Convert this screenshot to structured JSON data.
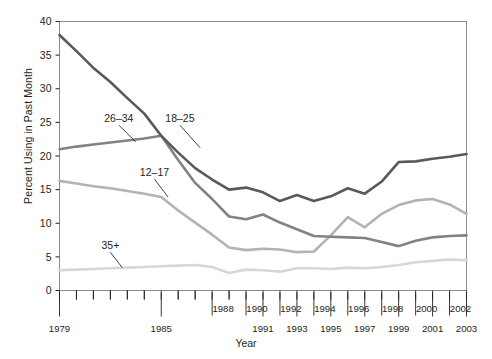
{
  "chart_data": {
    "type": "line",
    "title": "",
    "xlabel": "Year",
    "ylabel": "Percent Using in Past Month",
    "xlim": [
      1979,
      2003
    ],
    "ylim": [
      0,
      40
    ],
    "ytick_values": [
      0,
      5,
      10,
      15,
      20,
      25,
      30,
      35,
      40
    ],
    "ytick_labels": [
      "0",
      "5",
      "10",
      "15",
      "20",
      "25",
      "30",
      "35",
      "40"
    ],
    "grid": false,
    "legend_position": "inline-annotations",
    "x": [
      1979,
      1980,
      1981,
      1982,
      1983,
      1984,
      1985,
      1986,
      1987,
      1988,
      1989,
      1990,
      1991,
      1992,
      1993,
      1994,
      1995,
      1996,
      1997,
      1998,
      1999,
      2000,
      2001,
      2002,
      2003
    ],
    "xtick_upper_row": [
      {
        "year": 1988,
        "label": "1988"
      },
      {
        "year": 1990,
        "label": "1990"
      },
      {
        "year": 1992,
        "label": "1992"
      },
      {
        "year": 1994,
        "label": "1994"
      },
      {
        "year": 1996,
        "label": "1996"
      },
      {
        "year": 1998,
        "label": "1998"
      },
      {
        "year": 2000,
        "label": "2000"
      },
      {
        "year": 2002,
        "label": "2002"
      }
    ],
    "xtick_lower_row": [
      {
        "year": 1979,
        "label": "1979"
      },
      {
        "year": 1985,
        "label": "1985"
      },
      {
        "year": 1991,
        "label": "1991"
      },
      {
        "year": 1993,
        "label": "1993"
      },
      {
        "year": 1995,
        "label": "1995"
      },
      {
        "year": 1997,
        "label": "1997"
      },
      {
        "year": 1999,
        "label": "1999"
      },
      {
        "year": 2001,
        "label": "2001"
      },
      {
        "year": 2003,
        "label": "2003"
      }
    ],
    "series": [
      {
        "name": "18-25",
        "label": "18–25",
        "color": "#58595b",
        "width": 2.6,
        "annotation": {
          "text_x": 1986.1,
          "text_y": 25.1,
          "leader_to_x": 1987.3,
          "leader_to_y": 21.2
        },
        "values": [
          38.0,
          35.6,
          33.1,
          31.0,
          28.6,
          26.3,
          23.0,
          20.5,
          18.2,
          16.5,
          15.0,
          15.3,
          14.6,
          13.3,
          14.2,
          13.3,
          14.0,
          15.2,
          14.4,
          16.2,
          19.1,
          19.2,
          19.6,
          19.9,
          20.3
        ]
      },
      {
        "name": "26-34",
        "label": "26–34",
        "color": "#808285",
        "width": 2.6,
        "annotation": {
          "text_x": 1982.5,
          "text_y": 25.1,
          "leader_to_x": 1983.5,
          "leader_to_y": 22.1
        },
        "values": [
          21.0,
          21.4,
          21.7,
          22.0,
          22.3,
          22.6,
          23.0,
          19.4,
          16.0,
          13.6,
          11.0,
          10.6,
          11.3,
          10.1,
          9.1,
          8.1,
          8.0,
          7.9,
          7.8,
          7.2,
          6.6,
          7.4,
          7.9,
          8.1,
          8.2
        ]
      },
      {
        "name": "12-17",
        "label": "12–17",
        "color": "#b1b3b5",
        "width": 2.6,
        "annotation": {
          "text_x": 1984.6,
          "text_y": 17.1,
          "leader_to_x": 1985.4,
          "leader_to_y": 13.9
        },
        "values": [
          16.3,
          15.9,
          15.5,
          15.2,
          14.8,
          14.4,
          13.9,
          11.9,
          10.1,
          8.3,
          6.4,
          6.0,
          6.2,
          6.1,
          5.7,
          5.8,
          8.2,
          10.9,
          9.4,
          11.4,
          12.7,
          13.4,
          13.6,
          12.8,
          11.4
        ]
      },
      {
        "name": "35+",
        "label": "35+",
        "color": "#d6d7d9",
        "width": 2.6,
        "annotation": {
          "text_x": 1982.0,
          "text_y": 6.2,
          "leader_to_x": 1982.7,
          "leader_to_y": 3.4
        },
        "values": [
          3.0,
          3.1,
          3.2,
          3.3,
          3.4,
          3.5,
          3.6,
          3.7,
          3.8,
          3.5,
          2.6,
          3.1,
          3.0,
          2.8,
          3.3,
          3.3,
          3.2,
          3.4,
          3.3,
          3.5,
          3.8,
          4.2,
          4.4,
          4.6,
          4.5
        ]
      }
    ]
  }
}
